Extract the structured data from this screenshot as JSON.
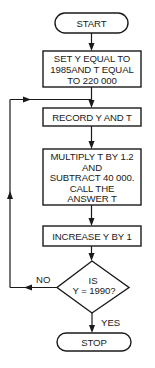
{
  "diagram": {
    "type": "flowchart",
    "nodes": {
      "start": {
        "shape": "terminal",
        "label": "START"
      },
      "init": {
        "shape": "process",
        "lines": [
          "SET Y EQUAL TO",
          "1985AND T EQUAL",
          "TO 220 000"
        ]
      },
      "record": {
        "shape": "process",
        "lines": [
          "RECORD Y AND T"
        ]
      },
      "multiply": {
        "shape": "process",
        "lines": [
          "MULTIPLY T BY 1.2",
          "AND",
          "SUBTRACT 40 000.",
          "CALL THE",
          "ANSWER T"
        ]
      },
      "increase": {
        "shape": "process",
        "lines": [
          "INCREASE Y BY 1"
        ]
      },
      "decision": {
        "shape": "decision",
        "lines": [
          "IS",
          "Y = 1990?"
        ]
      },
      "stop": {
        "shape": "terminal",
        "label": "STOP"
      }
    },
    "edges": {
      "no_label": "NO",
      "yes_label": "YES"
    },
    "colors": {
      "stroke": "#1a1a1a",
      "background": "#ffffff"
    }
  }
}
